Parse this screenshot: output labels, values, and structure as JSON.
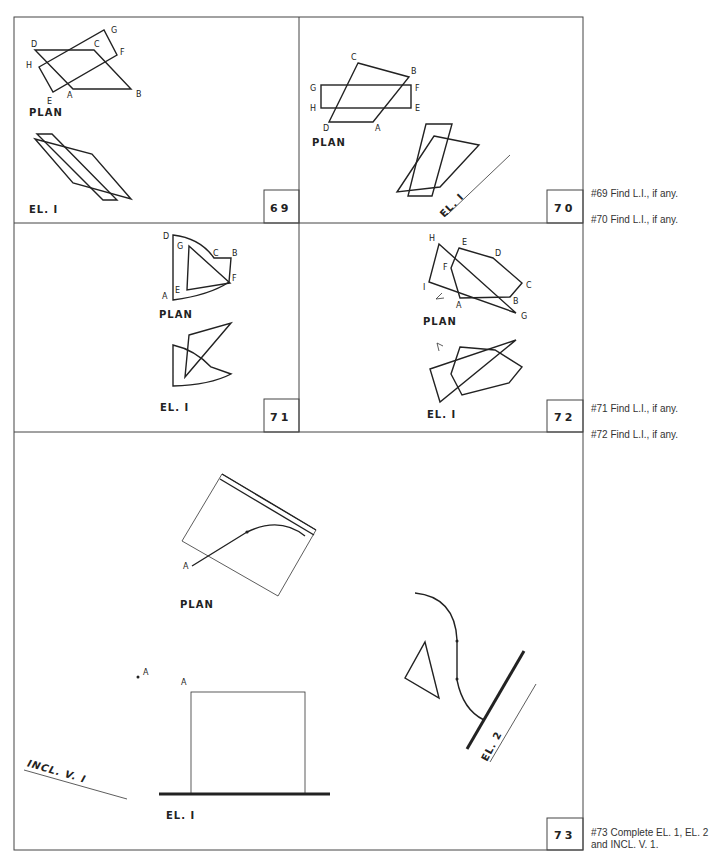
{
  "problems": [
    {
      "number": "69",
      "views": {
        "plan": "PLAN",
        "elevation": "EL. I"
      },
      "points": [
        "A",
        "B",
        "C",
        "D",
        "E",
        "F",
        "G",
        "H"
      ],
      "instruction": "#69 Find L.I., if any."
    },
    {
      "number": "70",
      "views": {
        "plan": "PLAN",
        "elevation": "EL. I"
      },
      "points": [
        "A",
        "B",
        "C",
        "D",
        "E",
        "F",
        "G",
        "H"
      ],
      "instruction": "#70 Find L.I., if any."
    },
    {
      "number": "71",
      "views": {
        "plan": "PLAN",
        "elevation": "EL. I"
      },
      "points": [
        "A",
        "B",
        "C",
        "D",
        "E",
        "F",
        "G"
      ],
      "instruction": "#71 Find L.I., if any."
    },
    {
      "number": "72",
      "views": {
        "plan": "PLAN",
        "elevation": "EL. I"
      },
      "points": [
        "A",
        "B",
        "C",
        "D",
        "E",
        "F",
        "G",
        "H",
        "I"
      ],
      "instruction": "#72 Find L.I., if any."
    },
    {
      "number": "73",
      "views": {
        "plan": "PLAN",
        "elevation": "EL. I",
        "elevation2": "EL. 2",
        "inclined": "INCL. V. I"
      },
      "points": [
        "A"
      ],
      "instruction_line1": "#73 Complete EL. 1, EL. 2",
      "instruction_line2": "and INCL. V. 1."
    }
  ],
  "labels": {
    "A": "A",
    "B": "B",
    "C": "C",
    "D": "D",
    "E": "E",
    "F": "F",
    "G": "G",
    "H": "H",
    "I": "I"
  },
  "colors": {
    "ink": "#222222",
    "paper": "#ffffff",
    "note": "#333333"
  }
}
